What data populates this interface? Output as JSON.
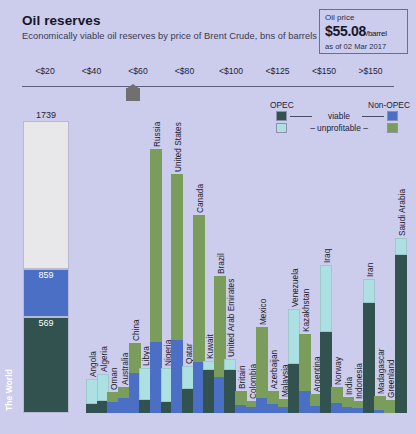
{
  "header": {
    "title": "Oil reserves",
    "subtitle": "Economically viable oil reserves by price of Brent Crude, bns of barrels"
  },
  "price_box": {
    "label": "Oil price",
    "value": "$55.08",
    "unit": "/barrel",
    "date": "as of 02 Mar 2017"
  },
  "legend": {
    "opec_label": "OPEC",
    "nonopec_label": "Non-OPEC",
    "viable_label": "viable",
    "unprofitable_label": "– unprofitable –",
    "colors": {
      "opec_viable": "#31524f",
      "opec_unprofitable": "#ade0e3",
      "nonopec_viable": "#4a6fc4",
      "nonopec_unprofitable": "#7a9d5c",
      "world_unprofitable": "#e8e8ea",
      "background": "#ccccec"
    }
  },
  "chart_data": {
    "type": "bar",
    "title": "Oil reserves",
    "subtitle": "Economically viable oil reserves by price of Brent Crude, bns of barrels",
    "ylabel": "bns of barrels",
    "xlabel": "",
    "price_axis": {
      "ticks": [
        "<$20",
        "<$40",
        "<$60",
        "<$80",
        "<$100",
        "<$125",
        "<$150",
        ">$150"
      ],
      "marker_at": "<$60"
    },
    "world": {
      "name": "The World",
      "total": 1739,
      "segments": [
        {
          "label": "569",
          "value": 569,
          "kind": "opec_viable"
        },
        {
          "label": "859",
          "value": 859,
          "kind": "nonopec_viable"
        },
        {
          "label": "1739",
          "value": 1739,
          "kind": "unprofitable"
        }
      ]
    },
    "categories": [
      "Angola",
      "Algeria",
      "Oman",
      "Australia",
      "China",
      "Libya",
      "Russia",
      "Nigeria",
      "United States",
      "Qatar",
      "Canada",
      "Kuwait",
      "Brazil",
      "United Arab Emirates",
      "Britain",
      "Colombia",
      "Mexico",
      "Azerbaijan",
      "Malaysia",
      "Venezuela",
      "Kazakhstan",
      "Argentina",
      "Iraq",
      "Norway",
      "India",
      "Indonesia",
      "Iran",
      "Madagascar",
      "Greenland",
      "Saudi Arabia"
    ],
    "bars": [
      {
        "name": "Angola",
        "opec": true,
        "viable": 9,
        "unprofitable": 24,
        "label_pos": "low"
      },
      {
        "name": "Algeria",
        "opec": true,
        "viable": 12,
        "unprofitable": 26,
        "label_pos": "mid"
      },
      {
        "name": "Oman",
        "opec": false,
        "viable": 11,
        "unprofitable": 10,
        "label_pos": "high"
      },
      {
        "name": "Australia",
        "opec": false,
        "viable": 15,
        "unprofitable": 11,
        "label_pos": "high"
      },
      {
        "name": "China",
        "opec": false,
        "viable": 39,
        "unprofitable": 30,
        "label_pos": "mid"
      },
      {
        "name": "Libya",
        "opec": true,
        "viable": 13,
        "unprofitable": 31,
        "label_pos": "low"
      },
      {
        "name": "Russia",
        "opec": false,
        "viable": 70,
        "unprofitable": 190,
        "label_pos": "low"
      },
      {
        "name": "Nigeria",
        "opec": true,
        "viable": 11,
        "unprofitable": 33,
        "label_pos": "low"
      },
      {
        "name": "United States",
        "opec": false,
        "viable": 72,
        "unprofitable": 163,
        "label_pos": "mid"
      },
      {
        "name": "Qatar",
        "opec": true,
        "viable": 24,
        "unprofitable": 22,
        "label_pos": "low"
      },
      {
        "name": "Canada",
        "opec": false,
        "viable": 50,
        "unprofitable": 145,
        "label_pos": "mid"
      },
      {
        "name": "Kuwait",
        "opec": true,
        "viable": 42,
        "unprofitable": 9,
        "label_pos": "low"
      },
      {
        "name": "Brazil",
        "opec": false,
        "viable": 35,
        "unprofitable": 100,
        "label_pos": "mid"
      },
      {
        "name": "United Arab Emirates",
        "opec": true,
        "viable": 42,
        "unprofitable": 11,
        "label_pos": "low"
      },
      {
        "name": "Britain",
        "opec": false,
        "viable": 8,
        "unprofitable": 14,
        "label_pos": "high"
      },
      {
        "name": "Colombia",
        "opec": false,
        "viable": 6,
        "unprofitable": 6,
        "label_pos": "high"
      },
      {
        "name": "Mexico",
        "opec": false,
        "viable": 15,
        "unprofitable": 70,
        "label_pos": "mid"
      },
      {
        "name": "Azerbaijan",
        "opec": false,
        "viable": 9,
        "unprofitable": 13,
        "label_pos": "high"
      },
      {
        "name": "Malaysia",
        "opec": false,
        "viable": 6,
        "unprofitable": 8,
        "label_pos": "high"
      },
      {
        "name": "Venezuela",
        "opec": true,
        "viable": 48,
        "unprofitable": 54,
        "label_pos": "low"
      },
      {
        "name": "Kazakhstan",
        "opec": false,
        "viable": 22,
        "unprofitable": 56,
        "label_pos": "mid"
      },
      {
        "name": "Argentina",
        "opec": false,
        "viable": 7,
        "unprofitable": 12,
        "label_pos": "high"
      },
      {
        "name": "Iraq",
        "opec": true,
        "viable": 80,
        "unprofitable": 66,
        "label_pos": "low"
      },
      {
        "name": "Norway",
        "opec": false,
        "viable": 10,
        "unprofitable": 16,
        "label_pos": "high"
      },
      {
        "name": "India",
        "opec": false,
        "viable": 6,
        "unprofitable": 10,
        "label_pos": "high"
      },
      {
        "name": "Indonesia",
        "opec": false,
        "viable": 5,
        "unprofitable": 7,
        "label_pos": "high"
      },
      {
        "name": "Iran",
        "opec": true,
        "viable": 108,
        "unprofitable": 24,
        "label_pos": "low"
      },
      {
        "name": "Madagascar",
        "opec": false,
        "viable": 3,
        "unprofitable": 14,
        "label_pos": "high"
      },
      {
        "name": "Greenland",
        "opec": false,
        "viable": 0,
        "unprofitable": 13,
        "label_pos": "high"
      },
      {
        "name": "Saudi Arabia",
        "opec": true,
        "viable": 156,
        "unprofitable": 16,
        "label_pos": "low"
      }
    ]
  }
}
